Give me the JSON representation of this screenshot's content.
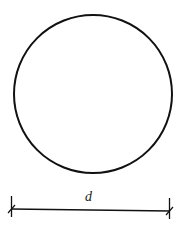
{
  "diagram": {
    "shape": "circle",
    "dimension": {
      "label": "d",
      "meaning": "diameter"
    },
    "colors": {
      "stroke": "#111111",
      "background": "#ffffff"
    }
  }
}
